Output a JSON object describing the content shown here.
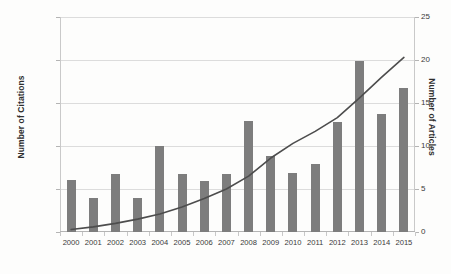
{
  "chart_data": {
    "type": "bar",
    "title": "",
    "xlabel": "",
    "ylabel": "Number of Citations",
    "y2label": "Number of Articles",
    "categories": [
      "2000",
      "2001",
      "2002",
      "2003",
      "2004",
      "2005",
      "2006",
      "2007",
      "2008",
      "2009",
      "2010",
      "2011",
      "2012",
      "2013",
      "2014",
      "2015"
    ],
    "ylim": [
      0,
      25000
    ],
    "y2lim": [
      0,
      25
    ],
    "yticks": [
      0,
      5000,
      10000,
      15000,
      20000,
      25000
    ],
    "yticklabels": [
      "0",
      "5000",
      "10000",
      "15000",
      "20000",
      "25000"
    ],
    "y2ticks": [
      0,
      5,
      10,
      15,
      20,
      25
    ],
    "y2ticklabels": [
      "0",
      "5",
      "10",
      "15",
      "20",
      "25"
    ],
    "grid": true,
    "legend": "none",
    "series": [
      {
        "name": "Number of Citations",
        "kind": "bar",
        "axis": "left",
        "color": "#7d7d7d",
        "values": [
          6000,
          4000,
          6800,
          3900,
          10000,
          6800,
          5900,
          6800,
          12900,
          8800,
          6900,
          7900,
          12800,
          19900,
          13700,
          16800
        ]
      },
      {
        "name": "Number of Articles",
        "kind": "line",
        "axis": "right",
        "color": "#4d4d4d",
        "values": [
          0.3,
          0.6,
          1.0,
          1.5,
          2.1,
          2.9,
          3.9,
          5.0,
          6.5,
          8.6,
          10.3,
          11.7,
          13.3,
          15.6,
          18.0,
          20.3
        ]
      }
    ]
  }
}
